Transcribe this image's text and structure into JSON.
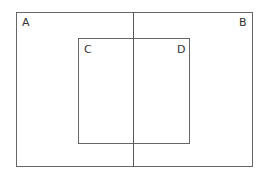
{
  "diagram": {
    "outer_rect": {
      "x": 16,
      "y": 12,
      "w": 237,
      "h": 154
    },
    "inner_rect": {
      "x": 78,
      "y": 38,
      "w": 112,
      "h": 106
    },
    "divider_x": 133,
    "labels": {
      "a": "A",
      "b": "B",
      "c": "C",
      "d": "D"
    },
    "line_color": "#666666"
  }
}
